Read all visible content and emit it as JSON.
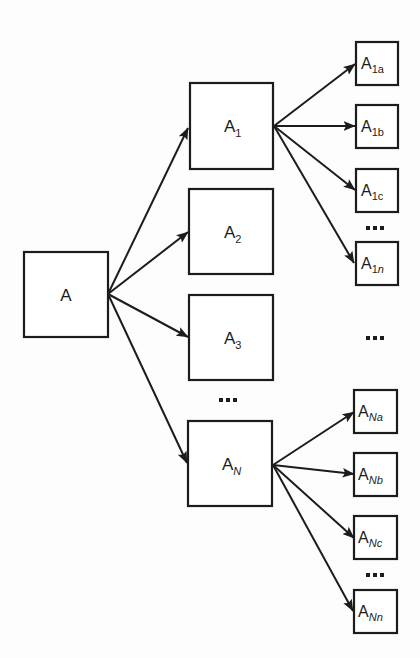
{
  "diagram": {
    "title": "",
    "nodes": {
      "root": {
        "base": "A",
        "sub": ""
      },
      "l1": [
        {
          "base": "A",
          "sub": "1",
          "sub_italic": false
        },
        {
          "base": "A",
          "sub": "2",
          "sub_italic": false
        },
        {
          "base": "A",
          "sub": "3",
          "sub_italic": false
        },
        {
          "base": "A",
          "sub": "N",
          "sub_italic": true
        }
      ],
      "l2_a1": [
        {
          "base": "A",
          "sub_num": "1",
          "sub_letter": "a",
          "letter_italic": false
        },
        {
          "base": "A",
          "sub_num": "1",
          "sub_letter": "b",
          "letter_italic": false
        },
        {
          "base": "A",
          "sub_num": "1",
          "sub_letter": "c",
          "letter_italic": false
        },
        {
          "base": "A",
          "sub_num": "1",
          "sub_letter": "n",
          "letter_italic": true
        }
      ],
      "l2_an": [
        {
          "base": "A",
          "sub_num": "N",
          "sub_letter": "a",
          "letter_italic": true
        },
        {
          "base": "A",
          "sub_num": "N",
          "sub_letter": "b",
          "letter_italic": true
        },
        {
          "base": "A",
          "sub_num": "N",
          "sub_letter": "c",
          "letter_italic": true
        },
        {
          "base": "A",
          "sub_num": "N",
          "sub_letter": "n",
          "letter_italic": true
        }
      ]
    },
    "ellipsis": "…",
    "edges": [
      [
        "A",
        "A1"
      ],
      [
        "A",
        "A2"
      ],
      [
        "A",
        "A3"
      ],
      [
        "A",
        "AN"
      ],
      [
        "A1",
        "A1a"
      ],
      [
        "A1",
        "A1b"
      ],
      [
        "A1",
        "A1c"
      ],
      [
        "A1",
        "A1n"
      ],
      [
        "AN",
        "ANa"
      ],
      [
        "AN",
        "ANb"
      ],
      [
        "AN",
        "ANc"
      ],
      [
        "AN",
        "ANn"
      ]
    ],
    "colors": {
      "line": "#1c1c1c",
      "fill": "#ffffff",
      "background": "#fdfdfd"
    }
  }
}
